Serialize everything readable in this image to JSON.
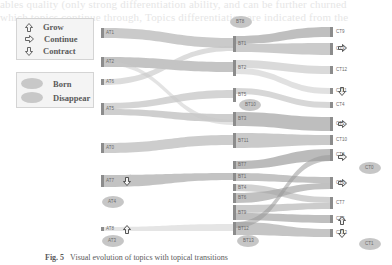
{
  "background_text": [
    "ables quality (only strong differentiation ability, and can be further churned",
    "which topics continue through, Topics differentiation are indicated from the"
  ],
  "legend": {
    "transitions": [
      {
        "icon": "up-arrow-icon",
        "label": "Grow"
      },
      {
        "icon": "right-arrow-icon",
        "label": "Continue"
      },
      {
        "icon": "down-arrow-icon",
        "label": "Contract"
      }
    ],
    "events": [
      {
        "icon": "ellipse-icon",
        "label": "Born"
      },
      {
        "icon": "ellipse-icon",
        "label": "Disappear"
      }
    ]
  },
  "columns": {
    "A": [
      {
        "id": "AT1",
        "y": 28,
        "h": 10
      },
      {
        "id": "AT2",
        "y": 57,
        "h": 10
      },
      {
        "id": "AT6",
        "y": 79,
        "h": 6
      },
      {
        "id": "AT5",
        "y": 103,
        "h": 12
      },
      {
        "id": "AT0",
        "y": 143,
        "h": 10
      },
      {
        "id": "AT7",
        "y": 175,
        "h": 12
      },
      {
        "id": "AT8",
        "y": 227,
        "h": 4
      }
    ],
    "B": [
      {
        "id": "BT1",
        "y": 36,
        "h": 16
      },
      {
        "id": "BT2",
        "y": 60,
        "h": 16
      },
      {
        "id": "BT5",
        "y": 88,
        "h": 14
      },
      {
        "id": "BT3",
        "y": 112,
        "h": 14
      },
      {
        "id": "BT11",
        "y": 133,
        "h": 15
      },
      {
        "id": "BT7",
        "y": 161,
        "h": 8
      },
      {
        "id": "BT1",
        "y": 173,
        "h": 8
      },
      {
        "id": "BT4",
        "y": 184,
        "h": 7
      },
      {
        "id": "BT6",
        "y": 193,
        "h": 10
      },
      {
        "id": "BT9",
        "y": 205,
        "h": 15
      },
      {
        "id": "BT12",
        "y": 222,
        "h": 13
      }
    ],
    "C": [
      {
        "id": "CT9",
        "y": 27,
        "h": 10
      },
      {
        "id": "CT3",
        "y": 43,
        "h": 12
      },
      {
        "id": "CT12",
        "y": 66,
        "h": 8
      },
      {
        "id": "CT11",
        "y": 88,
        "h": 6
      },
      {
        "id": "CT4",
        "y": 102,
        "h": 6
      },
      {
        "id": "CT1",
        "y": 117,
        "h": 14
      },
      {
        "id": "CT10",
        "y": 135,
        "h": 10
      },
      {
        "id": "CT8",
        "y": 149,
        "h": 12
      },
      {
        "id": "CT6",
        "y": 177,
        "h": 12
      },
      {
        "id": "CT7",
        "y": 197,
        "h": 12
      },
      {
        "id": "CT5",
        "y": 215,
        "h": 8
      },
      {
        "id": "CT13",
        "y": 229,
        "h": 8
      }
    ]
  },
  "born_disappear": [
    {
      "label": "BT8",
      "x": 241,
      "y": 22
    },
    {
      "label": "BT10",
      "x": 250,
      "y": 105
    },
    {
      "label": "AT4",
      "x": 113,
      "y": 202
    },
    {
      "label": "AT3",
      "x": 113,
      "y": 241
    },
    {
      "label": "BT13",
      "x": 248,
      "y": 241
    },
    {
      "label": "CT0",
      "x": 370,
      "y": 168
    },
    {
      "label": "CT1",
      "x": 370,
      "y": 244
    }
  ],
  "transition_markers": [
    {
      "icon": "right-arrow-icon",
      "x": 342,
      "y": 48
    },
    {
      "icon": "down-arrow-icon",
      "x": 342,
      "y": 91
    },
    {
      "icon": "right-arrow-icon",
      "x": 342,
      "y": 124
    },
    {
      "icon": "right-arrow-icon",
      "x": 342,
      "y": 157
    },
    {
      "icon": "right-arrow-icon",
      "x": 342,
      "y": 183
    },
    {
      "icon": "up-arrow-icon",
      "x": 342,
      "y": 220
    },
    {
      "icon": "down-arrow-icon",
      "x": 342,
      "y": 233
    },
    {
      "icon": "down-arrow-icon",
      "x": 127,
      "y": 181
    },
    {
      "icon": "up-arrow-icon",
      "x": 127,
      "y": 229
    }
  ],
  "caption": {
    "fig": "Fig. 5",
    "text": "Visual evolution of topics with topical transitions"
  }
}
